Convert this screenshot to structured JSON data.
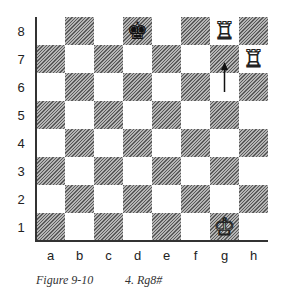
{
  "diagram": {
    "type": "chess-board",
    "files": [
      "a",
      "b",
      "c",
      "d",
      "e",
      "f",
      "g",
      "h"
    ],
    "ranks": [
      "8",
      "7",
      "6",
      "5",
      "4",
      "3",
      "2",
      "1"
    ],
    "pieces": [
      {
        "square": "d8",
        "piece": "king",
        "color": "black",
        "glyph": "♚"
      },
      {
        "square": "g8",
        "piece": "rook",
        "color": "white",
        "glyph": "♖"
      },
      {
        "square": "h7",
        "piece": "rook",
        "color": "white",
        "glyph": "♖"
      },
      {
        "square": "g1",
        "piece": "king",
        "color": "white",
        "glyph": "♔"
      }
    ],
    "move_arrow": {
      "from": "g6",
      "to": "g7",
      "label": "rook moves g-file to g8"
    },
    "colors": {
      "dark_square": "#8a8a8a",
      "light_square": "#ffffff",
      "border": "#333333"
    }
  },
  "caption": {
    "figure": "Figure 9-10",
    "move": "4. Rg8#"
  }
}
